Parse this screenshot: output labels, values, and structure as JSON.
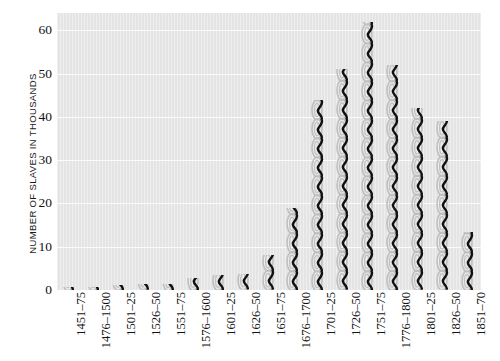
{
  "chart_data": {
    "type": "bar",
    "title": "",
    "subtitle": "",
    "xlabel": "",
    "ylabel": "NUMBER OF SLAVES IN THOUSANDS",
    "ylim": [
      0,
      64
    ],
    "yticks": [
      0,
      10,
      20,
      30,
      40,
      50,
      60
    ],
    "ytick_labels": [
      "0",
      "10",
      "20",
      "30",
      "40",
      "50",
      "60"
    ],
    "grid": true,
    "legend": null,
    "categories": [
      "1451–75",
      "1476–1500",
      "1501–25",
      "1526–50",
      "1551–75",
      "1576–1600",
      "1601–25",
      "1626–50",
      "1651–75",
      "1676–1700",
      "1701–25",
      "1726–50",
      "1751–75",
      "1776–1800",
      "1801–25",
      "1826–50",
      "1851–70"
    ],
    "values": [
      0.8,
      0.8,
      1.2,
      1.3,
      1.5,
      2.8,
      3.5,
      3.6,
      8.0,
      19.0,
      44.0,
      51.0,
      62.0,
      52.0,
      42.0,
      39.0,
      13.5
    ],
    "series": [
      {
        "name": "Slaves imported",
        "values": [
          0.8,
          0.8,
          1.2,
          1.3,
          1.5,
          2.8,
          3.5,
          3.6,
          8.0,
          19.0,
          44.0,
          51.0,
          62.0,
          52.0,
          42.0,
          39.0,
          13.5
        ]
      }
    ],
    "bar_style": "chain-link",
    "colors": {
      "plot_background": "#e7e7e7",
      "page_background": "#ffffff",
      "gridline": "#fbfbfb",
      "chain_outline": "#bfbfbf",
      "chain_shadow": "#111111",
      "tick_text": "#121212",
      "axis_title_text": "#1a1a1a"
    }
  }
}
